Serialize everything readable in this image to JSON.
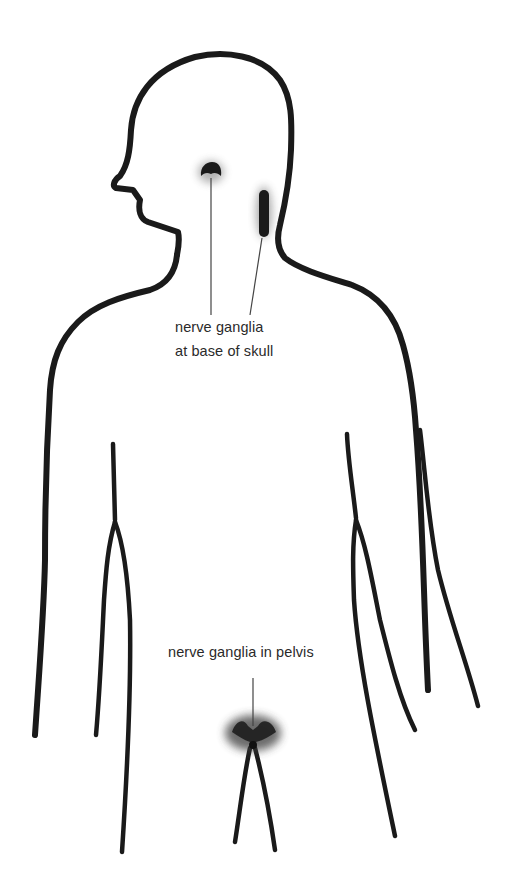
{
  "diagram": {
    "colors": {
      "outline": "#1a1a1a",
      "ganglia": "#222222",
      "leader_line": "#444444",
      "background": "#ffffff"
    },
    "labels": {
      "skull": {
        "line1": "nerve ganglia",
        "line2": "at base of skull"
      },
      "pelvis": {
        "text": "nerve ganglia in pelvis"
      }
    },
    "markers": [
      {
        "name": "ganglion-skull-center",
        "x": 211,
        "y": 172
      },
      {
        "name": "ganglion-skull-side",
        "x": 264,
        "y": 212
      },
      {
        "name": "ganglion-pelvis",
        "x": 253,
        "y": 731
      }
    ]
  }
}
